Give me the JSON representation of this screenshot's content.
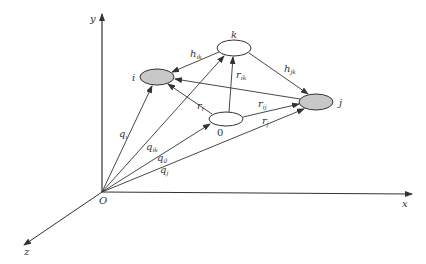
{
  "diagram": {
    "type": "3d-vector-diagram",
    "colors": {
      "line": "#333333",
      "node_fill_shaded": "#c8c8c8",
      "node_fill_plain": "#ffffff",
      "background": "#ffffff"
    },
    "axes": {
      "origin_label": "O",
      "x_label": "x",
      "y_label": "y",
      "z_label": "z"
    },
    "nodes": [
      {
        "id": "i",
        "label": "i",
        "shaded": true
      },
      {
        "id": "k",
        "label": "k",
        "shaded": false
      },
      {
        "id": "j",
        "label": "j",
        "shaded": true
      },
      {
        "id": "0",
        "label": "0",
        "shaded": false
      }
    ],
    "edges": {
      "h_ik": {
        "base": "h",
        "sub": "ik",
        "from": "k",
        "to": "i"
      },
      "h_jk": {
        "base": "h",
        "sub": "jk",
        "from": "k",
        "to": "j"
      },
      "r_ik": {
        "base": "r",
        "sub": "ik",
        "from": "0",
        "to": "k"
      },
      "r_i": {
        "base": "r",
        "sub": "i",
        "from": "0",
        "to": "i"
      },
      "r_ij": {
        "base": "r",
        "sub": "ij",
        "from": "0",
        "to": "j"
      },
      "r_j": {
        "base": "r",
        "sub": "j",
        "from": "O",
        "to": "j"
      },
      "j_to_i": {
        "from": "j",
        "to": "i"
      },
      "q_i": {
        "base": "q",
        "sub": "i",
        "from": "O",
        "to": "i"
      },
      "q_ik": {
        "base": "q",
        "sub": "ik",
        "from": "O",
        "to": "k"
      },
      "q_0": {
        "base": "q",
        "sub": "0",
        "from": "O",
        "to": "0"
      },
      "q_j": {
        "base": "q",
        "sub": "j",
        "from": "O",
        "to": "j"
      }
    }
  }
}
